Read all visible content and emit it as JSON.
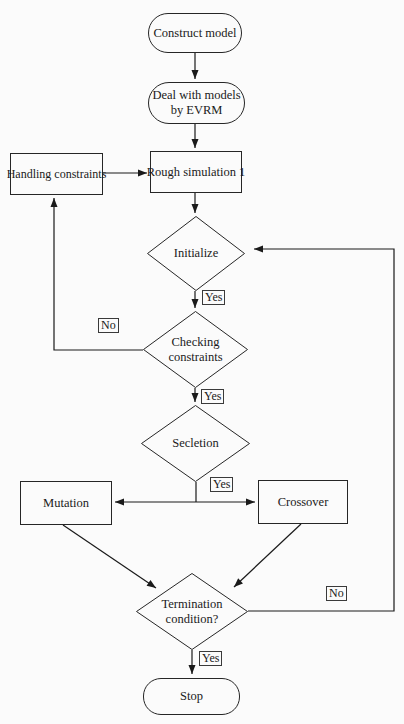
{
  "diagram_title": "Evolutionary optimization flowchart",
  "nodes": {
    "construct_model": {
      "label": "Construct model",
      "type": "terminator"
    },
    "deal_evrm": {
      "label": "Deal with models by EVRM",
      "type": "terminator"
    },
    "rough_simulation": {
      "label": "Rough simulation 1",
      "type": "process"
    },
    "handling_constraints": {
      "label": "Handling constraints",
      "type": "process"
    },
    "initialize": {
      "label": "Initialize",
      "type": "decision"
    },
    "checking_constraints": {
      "label": "Checking constraints",
      "type": "decision"
    },
    "selection": {
      "label": "Secletion",
      "type": "decision"
    },
    "mutation": {
      "label": "Mutation",
      "type": "process"
    },
    "crossover": {
      "label": "Crossover",
      "type": "process"
    },
    "termination": {
      "label": "Termination condition?",
      "type": "decision"
    },
    "stop": {
      "label": "Stop",
      "type": "terminator"
    }
  },
  "edge_labels": {
    "initialize_yes": "Yes",
    "checking_no": "No",
    "checking_yes": "Yes",
    "selection_yes": "Yes",
    "termination_no": "No",
    "termination_yes": "Yes"
  },
  "colors": {
    "line": "#1a1a1a",
    "border": "#262626",
    "text": "#1a1a1a",
    "background": "#fbfbfb"
  }
}
